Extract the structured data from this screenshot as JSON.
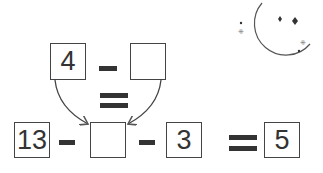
{
  "puzzle": {
    "top_row": {
      "left_box": "4",
      "operator": "-",
      "right_box": ""
    },
    "middle_equals": "=",
    "bottom_row": {
      "box_1": "13",
      "op_1": "-",
      "box_2": "",
      "op_2": "-",
      "box_3": "3",
      "equals": "=",
      "result_box": "5"
    }
  },
  "decoration": {
    "icon": "crescent-moon-with-stars-icon"
  },
  "colors": {
    "line": "#444444",
    "text": "#333333",
    "background": "#ffffff"
  }
}
